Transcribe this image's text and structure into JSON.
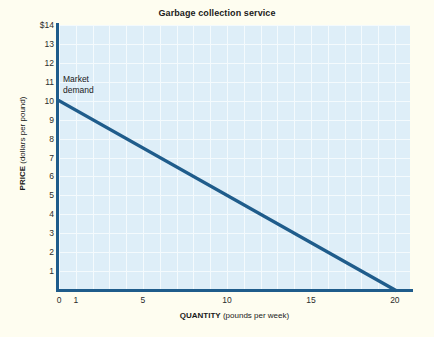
{
  "figure": {
    "title": "Garbage collection service",
    "background_color": "#FEFDF0",
    "plot_background_color": "#DEEEF8",
    "grid_color": "#F4FAFD",
    "axis_color": "#1F5C8B",
    "line_color": "#1F5C8B"
  },
  "annotations": {
    "market_demand": "Market\ndemand"
  },
  "axis_titles": {
    "y_strong": "PRICE",
    "y_rest": " (dollars per pound)",
    "x_strong": "QUANTITY",
    "x_rest": " (pounds per week)"
  },
  "chart_data": {
    "type": "line",
    "title": "Garbage collection service",
    "xlabel": "QUANTITY (pounds per week)",
    "ylabel": "PRICE (dollars per pound)",
    "xlim": [
      0,
      20.9
    ],
    "ylim": [
      0,
      14
    ],
    "grid": true,
    "grid_x_step": 1,
    "grid_y_step": 1,
    "legend": "none",
    "x_ticks": [
      {
        "value": 0,
        "label": "0"
      },
      {
        "value": 1,
        "label": "1"
      },
      {
        "value": 5,
        "label": "5"
      },
      {
        "value": 10,
        "label": "10"
      },
      {
        "value": 15,
        "label": "15"
      },
      {
        "value": 20,
        "label": "20"
      }
    ],
    "y_ticks": [
      {
        "value": 14,
        "label": "$14"
      },
      {
        "value": 13,
        "label": "13"
      },
      {
        "value": 12,
        "label": "12"
      },
      {
        "value": 11,
        "label": "11"
      },
      {
        "value": 10,
        "label": "10"
      },
      {
        "value": 9,
        "label": "9"
      },
      {
        "value": 8,
        "label": "8"
      },
      {
        "value": 7,
        "label": "7"
      },
      {
        "value": 6,
        "label": "6"
      },
      {
        "value": 5,
        "label": "5"
      },
      {
        "value": 4,
        "label": "4"
      },
      {
        "value": 3,
        "label": "3"
      },
      {
        "value": 2,
        "label": "2"
      },
      {
        "value": 1,
        "label": "1"
      }
    ],
    "series": [
      {
        "name": "Market demand",
        "color": "#1F5C8B",
        "points": [
          {
            "x": 0,
            "y": 10
          },
          {
            "x": 20,
            "y": 0
          }
        ]
      }
    ],
    "annotations": [
      {
        "text": "Market demand",
        "x": 0.3,
        "y": 11.2
      }
    ]
  }
}
